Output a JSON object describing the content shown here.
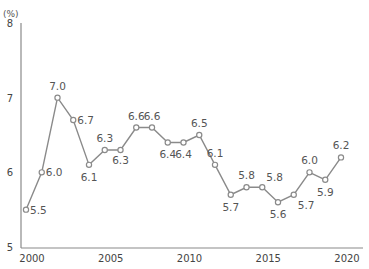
{
  "chart_data": {
    "type": "line",
    "title": "",
    "xlabel": "",
    "ylabel": "(%)",
    "x": [
      2000,
      2001,
      2002,
      2003,
      2004,
      2005,
      2006,
      2007,
      2008,
      2009,
      2010,
      2011,
      2012,
      2013,
      2014,
      2015,
      2016,
      2017,
      2018,
      2019,
      2020
    ],
    "series": [
      {
        "name": "",
        "values": [
          5.5,
          6.0,
          7.0,
          6.7,
          6.1,
          6.3,
          6.3,
          6.6,
          6.6,
          6.4,
          6.4,
          6.5,
          6.1,
          5.7,
          5.8,
          5.8,
          5.6,
          5.7,
          6.0,
          5.9,
          6.2
        ],
        "labels": [
          "5.5",
          "6.0",
          "7.0",
          "6.7",
          "6.1",
          "6.3",
          "6.3",
          "6.6",
          "6.6",
          "6.4",
          "6.4",
          "6.5",
          "6.1",
          "5.7",
          "5.8",
          "5.8",
          "5.6",
          "5.7",
          "6.0",
          "5.9",
          "6.2"
        ]
      }
    ],
    "ylim": [
      5,
      8
    ],
    "yticks": [
      5,
      6,
      7,
      8
    ],
    "xticks": [
      2000,
      2005,
      2010,
      2015,
      2020
    ],
    "grid": false,
    "legend": "none",
    "colors": {
      "line": "#8a8a8a",
      "marker_fill": "#ffffff",
      "axis": "#8a8a8a",
      "text": "#444444"
    }
  },
  "axis": {
    "unit_label": "(%)"
  }
}
